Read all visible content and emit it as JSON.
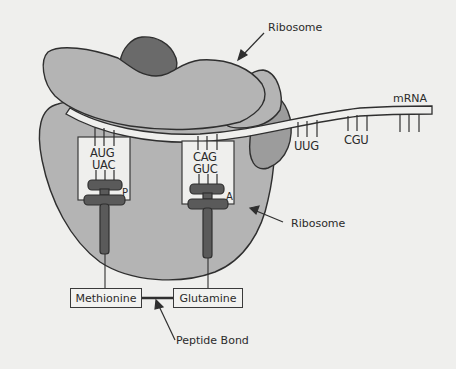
{
  "diagram": {
    "colors": {
      "background": "#efefed",
      "ribosome_light": "#b4b4b4",
      "ribosome_mid": "#9c9c9c",
      "ribosome_dark_cap": "#6a6a6a",
      "trna": "#5a5a5a",
      "outline": "#2f2f2f"
    },
    "labels": {
      "ribosome_top": "Ribosome",
      "ribosome_bottom": "Ribosome",
      "mrna": "mRNA",
      "peptide_bond": "Peptide Bond"
    },
    "sites": {
      "p_site": {
        "label": "P",
        "codon": "AUG",
        "anticodon": "UAC",
        "amino_acid": "Methionine"
      },
      "a_site": {
        "label": "A",
        "codon": "CAG",
        "anticodon": "GUC",
        "amino_acid": "Glutamine"
      }
    },
    "downstream_codons": [
      "UUG",
      "CGU",
      ""
    ]
  }
}
